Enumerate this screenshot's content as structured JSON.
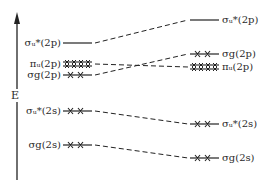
{
  "diagram": {
    "type": "molecular-orbital-energy-diagram",
    "axis": {
      "label": "E",
      "direction": "up"
    },
    "left_column": [
      {
        "id": "sigma_u_star_2p",
        "label": "σᵤ*(2p)",
        "electrons": "none",
        "y": 43
      },
      {
        "id": "pi_u_2p",
        "label": "πᵤ(2p)",
        "electrons": "4 (double, paired)",
        "y": 64
      },
      {
        "id": "sigma_g_2p",
        "label": "σ_g(2p)",
        "electrons": "2",
        "y": 75
      },
      {
        "id": "sigma_u_star_2s",
        "label": "σᵤ*(2s)",
        "electrons": "2",
        "y": 111
      },
      {
        "id": "sigma_g_2s",
        "label": "σ_g(2s)",
        "electrons": "2",
        "y": 145
      }
    ],
    "right_column": [
      {
        "id": "sigma_u_star_2p",
        "label": "σᵤ*(2p)",
        "electrons": "none",
        "y": 20
      },
      {
        "id": "sigma_g_2p",
        "label": "σ_g(2p)",
        "electrons": "2",
        "y": 54
      },
      {
        "id": "pi_u_2p",
        "label": "πᵤ(2p)",
        "electrons": "4 (double, paired)",
        "y": 67
      },
      {
        "id": "sigma_u_star_2s",
        "label": "σᵤ*(2s)",
        "electrons": "2",
        "y": 124
      },
      {
        "id": "sigma_g_2s",
        "label": "σ_g(2s)",
        "electrons": "2",
        "y": 158
      }
    ]
  },
  "labels": {
    "energy_axis": "E",
    "left": {
      "su2p": "σᵤ*(2p)",
      "pu2p": "πᵤ(2p)",
      "sg2p": "σg(2p)",
      "su2s": "σᵤ*(2s)",
      "sg2s": "σg(2s)"
    },
    "right": {
      "su2p": "σᵤ*(2p)",
      "sg2p": "σg(2p)",
      "pu2p": "πᵤ(2p)",
      "su2s": "σᵤ*(2s)",
      "sg2s": "σg(2s)"
    }
  }
}
